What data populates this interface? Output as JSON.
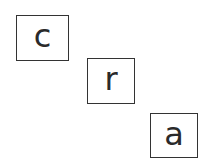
{
  "tiles": [
    {
      "letter": "c",
      "x": 16,
      "y": 15,
      "w": 53,
      "h": 46
    },
    {
      "letter": "r",
      "x": 87,
      "y": 58,
      "w": 48,
      "h": 46
    },
    {
      "letter": "a",
      "x": 150,
      "y": 113,
      "w": 48,
      "h": 45
    }
  ],
  "colors": {
    "border": "#333333",
    "text": "#2a2a2a",
    "background": "#ffffff"
  }
}
